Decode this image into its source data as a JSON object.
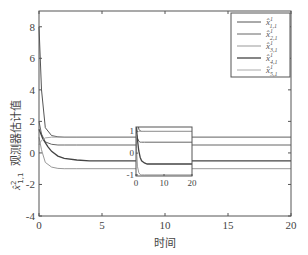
{
  "chart_data": {
    "type": "line",
    "title": "",
    "xlabel": "时间",
    "ylabel": "x̂²₁,₁ 观测器估计值",
    "ylabel_sub": "1,1",
    "ylabel_sup": "2",
    "ylabel_text": "观测器估计值",
    "xlim": [
      0,
      20
    ],
    "ylim": [
      -4,
      9
    ],
    "xticks": [
      0,
      5,
      10,
      15,
      20
    ],
    "yticks": [
      -4,
      -2,
      0,
      2,
      4,
      6,
      8
    ],
    "grid": false,
    "legend_position": "top-right",
    "series": [
      {
        "name": "x̂¹₁,₁",
        "sub": "1,1",
        "color": "#555555",
        "width": 1.0,
        "x": [
          0,
          0.2,
          0.5,
          1,
          1.5,
          2,
          3,
          5,
          10,
          20
        ],
        "values": [
          8.0,
          4.0,
          1.6,
          1.1,
          1.02,
          1.0,
          1.0,
          1.0,
          1.0,
          1.0
        ]
      },
      {
        "name": "x̂¹₂,₁",
        "sub": "2,1",
        "color": "#666666",
        "width": 1.0,
        "x": [
          0,
          0.2,
          0.5,
          1,
          1.5,
          2,
          3,
          5,
          10,
          20
        ],
        "values": [
          2.0,
          1.2,
          0.7,
          0.55,
          0.5,
          0.5,
          0.5,
          0.5,
          0.5,
          0.5
        ]
      },
      {
        "name": "x̂¹₃,₁",
        "sub": "3,1",
        "color": "#999999",
        "width": 1.0,
        "x": [
          0,
          0.2,
          0.5,
          1,
          1.5,
          2,
          3,
          5,
          10,
          20
        ],
        "values": [
          1.0,
          0.2,
          -0.6,
          -0.9,
          -0.98,
          -1.0,
          -1.0,
          -1.0,
          -1.0,
          -1.0
        ]
      },
      {
        "name": "x̂¹₄,₁",
        "sub": "4,1",
        "color": "#444444",
        "width": 1.3,
        "x": [
          0,
          0.3,
          0.7,
          1,
          1.5,
          2,
          3,
          4,
          6,
          10,
          20
        ],
        "values": [
          1.5,
          0.9,
          0.4,
          0.1,
          -0.2,
          -0.35,
          -0.45,
          -0.5,
          -0.5,
          -0.5,
          -0.5
        ]
      },
      {
        "name": "x̂¹₅,₁",
        "sub": "5,1",
        "color": "#aaaaaa",
        "width": 1.0,
        "x": [
          0,
          0.2,
          0.5,
          1,
          1.5,
          2,
          3,
          5,
          10,
          20
        ],
        "values": [
          0.5,
          0.8,
          0.95,
          1.0,
          1.0,
          1.0,
          1.0,
          1.0,
          1.0,
          1.0
        ]
      }
    ],
    "inset": {
      "xlim": [
        0,
        20
      ],
      "ylim": [
        -1.05,
        1.2
      ],
      "xticks": [
        0,
        10,
        20
      ],
      "yticks": [
        -1,
        0,
        1
      ]
    }
  },
  "legend": {
    "items": [
      {
        "base": "x̂",
        "sup": "1",
        "sub": "1,1"
      },
      {
        "base": "x̂",
        "sup": "1",
        "sub": "2,1"
      },
      {
        "base": "x̂",
        "sup": "1",
        "sub": "3,1"
      },
      {
        "base": "x̂",
        "sup": "1",
        "sub": "4,1"
      },
      {
        "base": "x̂",
        "sup": "1",
        "sub": "5,1"
      }
    ]
  }
}
